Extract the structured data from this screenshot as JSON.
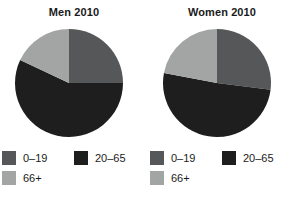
{
  "chart_data": [
    {
      "type": "pie",
      "title": "Men 2010",
      "categories": [
        "0–19",
        "20–65",
        "66+"
      ],
      "values": [
        25,
        57,
        18
      ],
      "colors": [
        "#555759",
        "#1e1e1e",
        "#a3a5a5"
      ],
      "units": "percent",
      "start_angle_deg": 0,
      "direction": "clockwise",
      "legend_position": "bottom",
      "grid": false,
      "xlabel": "",
      "ylabel": ""
    },
    {
      "type": "pie",
      "title": "Women 2010",
      "categories": [
        "0–19",
        "20–65",
        "66+"
      ],
      "values": [
        27,
        51,
        22
      ],
      "colors": [
        "#555759",
        "#1e1e1e",
        "#a3a5a5"
      ],
      "units": "percent",
      "start_angle_deg": 0,
      "direction": "clockwise",
      "legend_position": "bottom",
      "grid": false,
      "xlabel": "",
      "ylabel": ""
    }
  ],
  "panels": [
    {
      "title": "Men 2010",
      "legend": [
        {
          "label": "0–19",
          "color": "#555759"
        },
        {
          "label": "20–65",
          "color": "#1e1e1e"
        },
        {
          "label": "66+",
          "color": "#a3a5a5"
        }
      ]
    },
    {
      "title": "Women 2010",
      "legend": [
        {
          "label": "0–19",
          "color": "#555759"
        },
        {
          "label": "20–65",
          "color": "#1e1e1e"
        },
        {
          "label": "66+",
          "color": "#a3a5a5"
        }
      ]
    }
  ],
  "palette": {
    "age_0_19": "#555759",
    "age_20_65": "#1e1e1e",
    "age_66_plus": "#a3a5a5",
    "background": "#ffffff",
    "text": "#1a1a1a"
  }
}
